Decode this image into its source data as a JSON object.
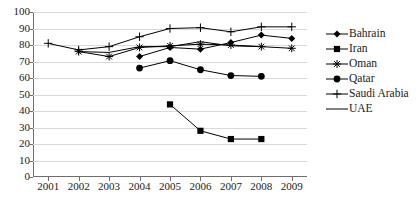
{
  "chart_data": {
    "type": "line",
    "title": "",
    "subtitle": "",
    "xlabel": "",
    "ylabel": "",
    "categories": [
      "2001",
      "2002",
      "2003",
      "2004",
      "2005",
      "2006",
      "2007",
      "2008",
      "2009"
    ],
    "x": [
      2001,
      2002,
      2003,
      2004,
      2005,
      2006,
      2007,
      2008,
      2009
    ],
    "xlim": [
      2000.5,
      2009.5
    ],
    "ylim": [
      0,
      100
    ],
    "ytick_labels": [
      "100",
      "90",
      "80",
      "70",
      "60",
      "50",
      "40",
      "30",
      "20",
      "10",
      "0"
    ],
    "ytick_values": [
      100,
      90,
      80,
      70,
      60,
      50,
      40,
      30,
      20,
      10,
      0
    ],
    "grid": true,
    "grid_axis": "y",
    "legend_position": "right",
    "series": [
      {
        "name": "Bahrain",
        "marker": "diamond",
        "color": "#000000",
        "values": [
          null,
          null,
          null,
          73,
          78.5,
          77.5,
          81.5,
          86,
          84
        ]
      },
      {
        "name": "Iran",
        "marker": "square",
        "color": "#000000",
        "values": [
          null,
          null,
          null,
          null,
          44,
          28,
          23,
          23,
          null
        ]
      },
      {
        "name": "Oman",
        "marker": "asterisk",
        "color": "#000000",
        "values": [
          null,
          76,
          73,
          78.5,
          79.5,
          80.5,
          80,
          79,
          78
        ]
      },
      {
        "name": "Qatar",
        "marker": "circle",
        "color": "#000000",
        "values": [
          null,
          null,
          null,
          66,
          70.5,
          65,
          61.5,
          61,
          null
        ]
      },
      {
        "name": "Saudi Arabia",
        "marker": "plus",
        "color": "#000000",
        "values": [
          81,
          77,
          79,
          85,
          90,
          90.5,
          88,
          91,
          91
        ]
      },
      {
        "name": "UAE",
        "marker": "none",
        "color": "#000000",
        "values": [
          null,
          76,
          75.5,
          79,
          79,
          82,
          79.5,
          79,
          null
        ]
      }
    ]
  },
  "legend": {
    "items": [
      {
        "label": "Bahrain",
        "marker": "diamond"
      },
      {
        "label": "Iran",
        "marker": "square"
      },
      {
        "label": "Oman",
        "marker": "asterisk"
      },
      {
        "label": "Qatar",
        "marker": "circle"
      },
      {
        "label": "Saudi Arabia",
        "marker": "plus"
      },
      {
        "label": "UAE",
        "marker": "none"
      }
    ]
  },
  "colors": {
    "ink": "#000000",
    "axis": "#6e6e6e",
    "grid": "#d9d9d9",
    "background": "#ffffff"
  }
}
